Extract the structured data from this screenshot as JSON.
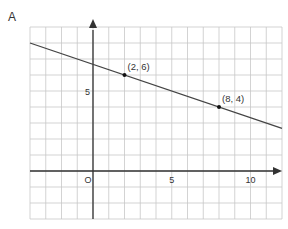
{
  "panel_label": "A",
  "chart_data": {
    "type": "line",
    "title": "",
    "xlabel": "",
    "ylabel": "",
    "xlim": [
      -4,
      12
    ],
    "ylim": [
      -3,
      9
    ],
    "grid": true,
    "x_ticks": [
      {
        "value": 5,
        "label": "5"
      },
      {
        "value": 10,
        "label": "10"
      }
    ],
    "y_ticks": [
      {
        "value": 5,
        "label": "5"
      }
    ],
    "origin_label": "O",
    "series": [
      {
        "name": "line",
        "slope": -0.3333,
        "intercept": 6.6667,
        "x": [
          -4,
          12
        ],
        "y": [
          8,
          2.6667
        ]
      }
    ],
    "points": [
      {
        "x": 2,
        "y": 6,
        "label": "(2, 6)"
      },
      {
        "x": 8,
        "y": 4,
        "label": "(8, 4)"
      }
    ],
    "colors": {
      "grid": "#c8c8c8",
      "axis": "#333333",
      "line": "#444444",
      "text": "#333333"
    }
  }
}
